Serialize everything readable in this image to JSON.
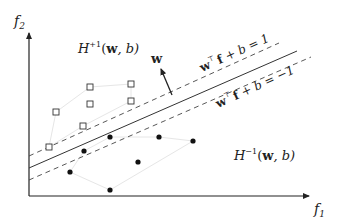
{
  "diagram": {
    "type": "svm-separating-hyperplane",
    "axes": {
      "x_label": "f",
      "x_sub": "1",
      "y_label": "f",
      "y_sub": "2"
    },
    "regions": {
      "positive": {
        "H": "H",
        "sup": "+1",
        "args": "(w, b)",
        "w": "w",
        "rest": ", b)",
        "open": "("
      },
      "negative": {
        "H": "H",
        "sup": "−1",
        "args": "(w, b)",
        "w": "w",
        "rest": ", b)",
        "open": "("
      }
    },
    "normal_vector_label": "w",
    "margin_labels": {
      "upper": {
        "w": "w",
        "T": "⊤",
        "f": "f",
        "rest": " + b = 1"
      },
      "lower": {
        "w": "w",
        "T": "⊤",
        "f": "f",
        "rest": " + b = −1"
      }
    },
    "colors": {
      "line": "#333333",
      "hull": "#e0e0e0",
      "point": "#111111"
    },
    "positive_points": [
      [
        56,
        112
      ],
      [
        90,
        87
      ],
      [
        90,
        104
      ],
      [
        131,
        84
      ],
      [
        131,
        101
      ],
      [
        83,
        126
      ],
      [
        49,
        147
      ]
    ],
    "negative_points": [
      [
        110,
        137
      ],
      [
        84,
        151
      ],
      [
        159,
        137
      ],
      [
        193,
        141
      ],
      [
        138,
        162
      ],
      [
        70,
        172
      ],
      [
        110,
        190
      ]
    ]
  }
}
